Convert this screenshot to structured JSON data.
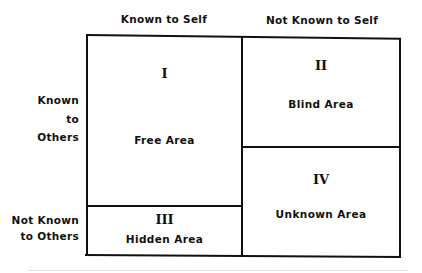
{
  "diagram": {
    "type": "johari-window",
    "columns": [
      {
        "label": "Known to Self"
      },
      {
        "label": "Not Known to Self"
      }
    ],
    "rows": [
      {
        "label_lines": [
          "Known",
          "to",
          "Others"
        ]
      },
      {
        "label_lines": [
          "Not Known",
          "to Others"
        ]
      }
    ],
    "quadrants": [
      {
        "numeral": "I",
        "name": "Free Area"
      },
      {
        "numeral": "II",
        "name": "Blind Area"
      },
      {
        "numeral": "III",
        "name": "Hidden Area"
      },
      {
        "numeral": "IV",
        "name": "Unknown Area"
      }
    ],
    "colors": {
      "line": "#111111",
      "background": "#ffffff"
    }
  }
}
